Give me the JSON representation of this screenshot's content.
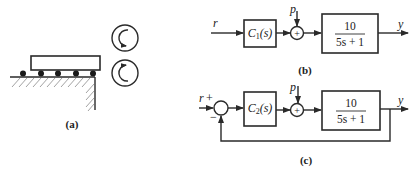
{
  "figure": {
    "panel_a": {
      "label": "(a)",
      "description": "platform on ball bearings over hatched ground with two rollers",
      "rollers": [
        {
          "name": "top-roller",
          "rotation": "clockwise-arrow-down"
        },
        {
          "name": "bottom-roller",
          "rotation": "arrow-up"
        }
      ],
      "ball_count": 5
    },
    "panel_b": {
      "label": "(b)",
      "input": "r",
      "disturbance": "p",
      "controller": {
        "name": "C",
        "sub": "1",
        "arg": "(s)"
      },
      "sum_sign": "+",
      "plant": {
        "numerator": "10",
        "denominator": "5s + 1"
      },
      "output": "y"
    },
    "panel_c": {
      "label": "(c)",
      "input": "r",
      "input_sign": "+",
      "feedback_sign": "−",
      "disturbance": "p",
      "controller": {
        "name": "C",
        "sub": "2",
        "arg": "(s)"
      },
      "sum_sign": "+",
      "plant": {
        "numerator": "10",
        "denominator": "5s + 1"
      },
      "output": "y"
    }
  }
}
